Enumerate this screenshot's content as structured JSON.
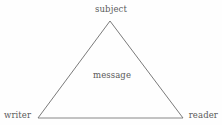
{
  "diagram": {
    "type": "rhetorical-triangle",
    "background_color": "#fefefe",
    "line_color": "#6b6b6b",
    "text_color": "#5a5a5a",
    "vertices": [
      {
        "id": "subject",
        "label": "subject",
        "x": 110,
        "y": 21,
        "label_position": "above"
      },
      {
        "id": "writer",
        "label": "writer",
        "x": 38,
        "y": 118,
        "label_position": "left"
      },
      {
        "id": "reader",
        "label": "reader",
        "x": 183,
        "y": 118,
        "label_position": "right"
      }
    ],
    "interior": {
      "id": "message",
      "label": "message",
      "x": 112,
      "y": 76
    },
    "edges": [
      {
        "from": "writer",
        "to": "subject"
      },
      {
        "from": "subject",
        "to": "reader"
      },
      {
        "from": "writer",
        "to": "reader"
      }
    ]
  }
}
